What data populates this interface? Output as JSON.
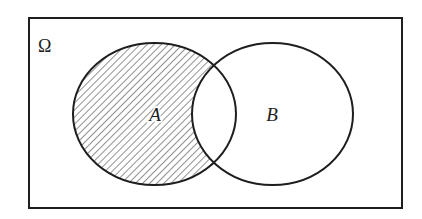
{
  "diagram": {
    "type": "venn",
    "universe": {
      "label": "Ω",
      "x": 29,
      "y": 18,
      "width": 373,
      "height": 190,
      "label_pos": {
        "x": 38,
        "y": 52
      }
    },
    "sets": [
      {
        "id": "A",
        "label": "A",
        "cx": 154.5,
        "cy": 114,
        "rx": 81.5,
        "ry": 71,
        "label_pos": {
          "x": 155,
          "y": 121
        },
        "shaded": true,
        "shading": "diagonal-hatch"
      },
      {
        "id": "B",
        "label": "B",
        "cx": 272.5,
        "cy": 114,
        "rx": 80.5,
        "ry": 71,
        "label_pos": {
          "x": 272,
          "y": 121
        },
        "shaded": false
      }
    ],
    "highlighted_region": "A \\ B",
    "colors": {
      "stroke": "#1e1e1e",
      "hatch": "#555555",
      "background": "#ffffff"
    }
  }
}
